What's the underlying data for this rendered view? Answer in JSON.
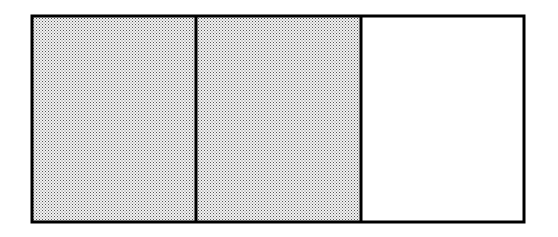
{
  "diagram": {
    "type": "fraction-bar",
    "total_parts": 3,
    "shaded_parts": 2,
    "parts": [
      {
        "index": 0,
        "shaded": true
      },
      {
        "index": 1,
        "shaded": true
      },
      {
        "index": 2,
        "shaded": false
      }
    ],
    "colors": {
      "border": "#000000",
      "shade_dot": "#555555",
      "shade_bg": "#f2f2f2",
      "unshaded": "#ffffff"
    }
  }
}
